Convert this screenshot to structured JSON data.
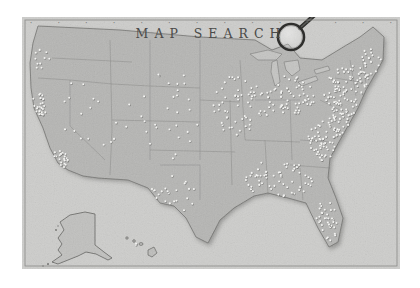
{
  "map": {
    "title": "MAP SEARCH",
    "subject": "United States",
    "style": "vintage grayscale",
    "frame_ticks": [
      "",
      "",
      "",
      "",
      "",
      "",
      "",
      "",
      "",
      "",
      "",
      "",
      "",
      ""
    ],
    "colors": {
      "paper": "#c9c9c7",
      "land": "#b4b4b2",
      "land_shadow": "#8a8a88",
      "ocean": "#cfcfcd",
      "border": "#7d7d7b",
      "pin": "#f4f4f2",
      "pin_shadow": "#5e5e5c",
      "title": "#4a4a48",
      "magnifier": "#3a3a38"
    },
    "magnifier": {
      "icon": "magnifying-glass",
      "cx": 291,
      "cy": 37,
      "r": 13,
      "handle_to_x": 318,
      "handle_to_y": 13
    },
    "pin_clusters": [
      {
        "region": "pacific-northwest",
        "cx": 40,
        "cy": 58,
        "rx": 10,
        "ry": 12,
        "count": 10
      },
      {
        "region": "california-north",
        "cx": 38,
        "cy": 105,
        "rx": 9,
        "ry": 14,
        "count": 28
      },
      {
        "region": "california-south",
        "cx": 58,
        "cy": 160,
        "rx": 10,
        "ry": 12,
        "count": 22
      },
      {
        "region": "mountain-west",
        "cx": 95,
        "cy": 110,
        "rx": 35,
        "ry": 40,
        "count": 18
      },
      {
        "region": "great-plains",
        "cx": 170,
        "cy": 115,
        "rx": 30,
        "ry": 45,
        "count": 28
      },
      {
        "region": "texas",
        "cx": 170,
        "cy": 195,
        "rx": 25,
        "ry": 20,
        "count": 22
      },
      {
        "region": "midwest",
        "cx": 240,
        "cy": 105,
        "rx": 30,
        "ry": 30,
        "count": 60
      },
      {
        "region": "great-lakes",
        "cx": 290,
        "cy": 95,
        "rx": 25,
        "ry": 22,
        "count": 60
      },
      {
        "region": "northeast",
        "cx": 350,
        "cy": 95,
        "rx": 26,
        "ry": 30,
        "count": 110
      },
      {
        "region": "new-england",
        "cx": 370,
        "cy": 65,
        "rx": 12,
        "ry": 16,
        "count": 22
      },
      {
        "region": "mid-atlantic",
        "cx": 330,
        "cy": 140,
        "rx": 22,
        "ry": 22,
        "count": 70
      },
      {
        "region": "southeast",
        "cx": 280,
        "cy": 180,
        "rx": 35,
        "ry": 22,
        "count": 60
      },
      {
        "region": "florida",
        "cx": 326,
        "cy": 223,
        "rx": 12,
        "ry": 22,
        "count": 34
      },
      {
        "region": "hawaii",
        "cx": 139,
        "cy": 245,
        "rx": 4,
        "ry": 2,
        "count": 2
      }
    ]
  }
}
